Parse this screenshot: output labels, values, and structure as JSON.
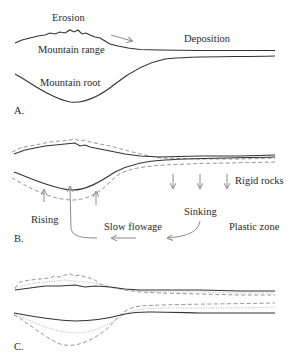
{
  "panels": {
    "a": {
      "letter": "A.",
      "labels": {
        "erosion": "Erosion",
        "mountain_range": "Mountain range",
        "deposition": "Deposition",
        "mountain_root": "Mountain root"
      }
    },
    "b": {
      "letter": "B.",
      "labels": {
        "rigid_rocks": "Rigid rocks",
        "rising": "Rising",
        "sinking": "Sinking",
        "slow_flowage": "Slow flowage",
        "plastic_zone": "Plastic zone"
      }
    },
    "c": {
      "letter": "C."
    }
  },
  "colors": {
    "solid_line": "#333333",
    "dashed_line": "#8a8a8a",
    "dotted_line": "#a8a8a8",
    "arrow": "#8a8a8a",
    "text": "#2a2a2a"
  }
}
